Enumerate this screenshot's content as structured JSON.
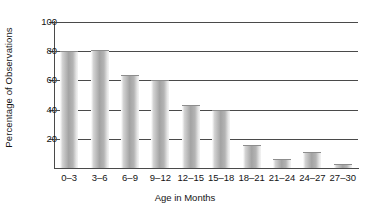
{
  "chart_data": {
    "type": "bar",
    "title": "",
    "xlabel": "Age in Months",
    "ylabel": "Percentage of Observations",
    "categories": [
      "0–3",
      "3–6",
      "6–9",
      "9–12",
      "12–15",
      "15–18",
      "18–21",
      "21–24",
      "24–27",
      "27–30"
    ],
    "values": [
      80,
      81,
      64,
      60,
      43,
      40,
      16,
      6,
      11,
      3
    ],
    "ylim": [
      0,
      100
    ],
    "yticks": [
      20,
      40,
      60,
      80,
      100
    ],
    "ytick_labels": [
      "20",
      "40",
      "60",
      "80",
      "100"
    ],
    "grid": "horizontal",
    "legend": "none",
    "bar_color": "#a3a3a3",
    "axis_color": "#4a4a4a",
    "background_color": "#ffffff"
  }
}
